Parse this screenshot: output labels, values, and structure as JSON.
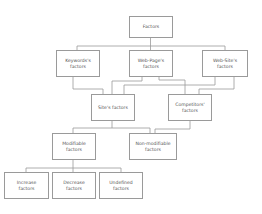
{
  "diagram": {
    "type": "hierarchy",
    "nodes": {
      "factors": {
        "line1": "Factors",
        "line2": ""
      },
      "keywords": {
        "line1": "Keywords's",
        "line2": "factors"
      },
      "webpage": {
        "line1": "Web-Page's",
        "line2": "factors"
      },
      "website": {
        "line1": "Web-Site's",
        "line2": "factors"
      },
      "site": {
        "line1": "Site's factors",
        "line2": ""
      },
      "competitors": {
        "line1": "Competitors'",
        "line2": "factors"
      },
      "modifiable": {
        "line1": "Modifiable",
        "line2": "factors"
      },
      "nonmodifiable": {
        "line1": "Non-modifiable",
        "line2": "factors"
      },
      "increase": {
        "line1": "Increase",
        "line2": "factors"
      },
      "decrease": {
        "line1": "Decrease",
        "line2": "factors"
      },
      "undefined": {
        "line1": "Undefined",
        "line2": "factors"
      }
    },
    "edges": [
      [
        "Factors",
        "Keywords's factors"
      ],
      [
        "Factors",
        "Web-Page's factors"
      ],
      [
        "Factors",
        "Web-Site's factors"
      ],
      [
        "Keywords's factors",
        "Site's factors"
      ],
      [
        "Web-Page's factors",
        "Site's factors"
      ],
      [
        "Web-Page's factors",
        "Competitors' factors"
      ],
      [
        "Web-Site's factors",
        "Site's factors"
      ],
      [
        "Web-Site's factors",
        "Competitors' factors"
      ],
      [
        "Site's factors",
        "Modifiable factors"
      ],
      [
        "Site's factors",
        "Non-modifiable factors"
      ],
      [
        "Competitors' factors",
        "Non-modifiable factors"
      ],
      [
        "Modifiable factors",
        "Increase factors"
      ],
      [
        "Modifiable factors",
        "Decrease factors"
      ],
      [
        "Modifiable factors",
        "Undefined factors"
      ]
    ],
    "colors": {
      "border": "#9a9a9a",
      "text": "#555555",
      "background": "#ffffff"
    }
  }
}
